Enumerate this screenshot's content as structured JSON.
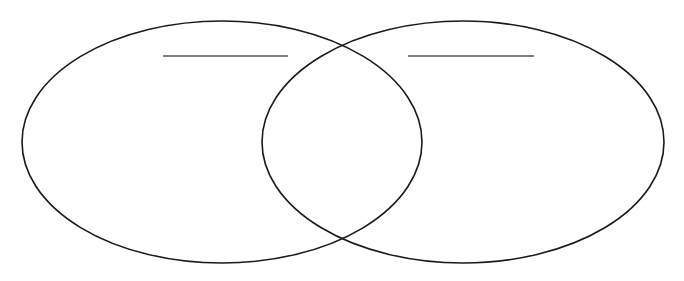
{
  "diagram": {
    "type": "venn",
    "sets": [
      {
        "id": "left",
        "label": "",
        "ellipse": {
          "cx": 222,
          "cy": 142,
          "rx": 200,
          "ry": 121
        },
        "label_line": {
          "x1": 163,
          "x2": 288,
          "y": 56
        }
      },
      {
        "id": "right",
        "label": "",
        "ellipse": {
          "cx": 463,
          "cy": 142,
          "rx": 201,
          "ry": 121
        },
        "label_line": {
          "x1": 408,
          "x2": 534,
          "y": 56
        }
      }
    ],
    "intersection_points": [
      {
        "x": 342,
        "y": 44
      },
      {
        "x": 342,
        "y": 239
      }
    ],
    "colors": {
      "stroke": "#1a1a1a",
      "label_line": "#555555",
      "background": "#ffffff"
    }
  }
}
